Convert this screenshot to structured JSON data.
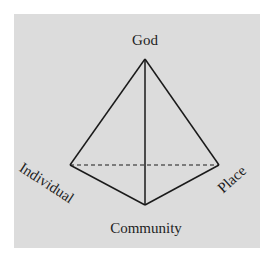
{
  "diagram": {
    "type": "tetrahedron",
    "background_color": "#dcdcdc",
    "line_color": "#1a1a1a",
    "nodes": {
      "apex": {
        "label": "God",
        "x": 145,
        "y": 59
      },
      "left": {
        "label": "Individual",
        "x": 70,
        "y": 165
      },
      "right": {
        "label": "Place",
        "x": 219,
        "y": 165
      },
      "bottom": {
        "label": "Community",
        "x": 145,
        "y": 205
      }
    },
    "edges": [
      {
        "from": "God",
        "to": "Individual",
        "style": "solid"
      },
      {
        "from": "God",
        "to": "Place",
        "style": "solid"
      },
      {
        "from": "God",
        "to": "Community",
        "style": "solid"
      },
      {
        "from": "Individual",
        "to": "Community",
        "style": "solid"
      },
      {
        "from": "Place",
        "to": "Community",
        "style": "solid"
      },
      {
        "from": "Individual",
        "to": "Place",
        "style": "dashed"
      }
    ]
  }
}
